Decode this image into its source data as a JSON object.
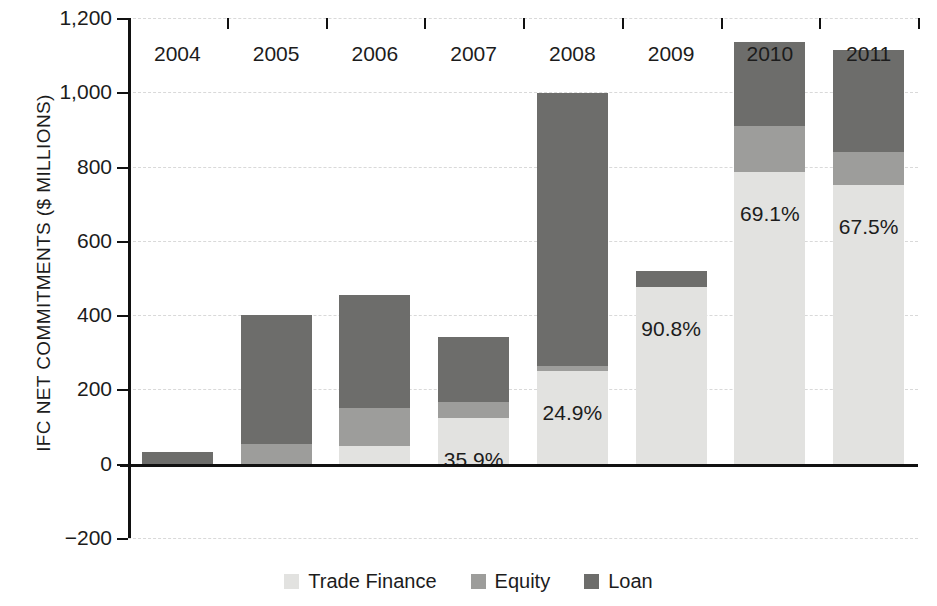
{
  "chart_data": {
    "type": "bar",
    "subtype": "stacked-bar",
    "title": "",
    "xlabel": "",
    "ylabel": "IFC NET COMMITMENTS ($ MILLIONS)",
    "categories": [
      "2004",
      "2005",
      "2006",
      "2007",
      "2008",
      "2009",
      "2010",
      "2011"
    ],
    "series": [
      {
        "name": "Trade Finance",
        "color": "#e2e2e0",
        "values": [
          0,
          0,
          48,
          122,
          250,
          475,
          785,
          750
        ]
      },
      {
        "name": "Equity",
        "color": "#9d9d9b",
        "values": [
          0,
          52,
          150,
          165,
          262,
          475,
          910,
          840
        ]
      },
      {
        "name": "Loan",
        "color": "#6d6d6b",
        "values": [
          32,
          400,
          455,
          340,
          998,
          520,
          1135,
          1115
        ]
      }
    ],
    "stack_note": "series values are cumulative stack tops in $ millions",
    "ylim": [
      -200,
      1200
    ],
    "yticks": [
      -200,
      0,
      200,
      400,
      600,
      800,
      1000,
      1200
    ],
    "ytick_labels": [
      "−200",
      "0",
      "200",
      "400",
      "600",
      "800",
      "1,000",
      "1,200"
    ],
    "grid": true,
    "legend_position": "bottom",
    "annotations": [
      {
        "category": "2007",
        "text": "35.9%"
      },
      {
        "category": "2008",
        "text": "24.9%"
      },
      {
        "category": "2009",
        "text": "90.8%"
      },
      {
        "category": "2010",
        "text": "69.1%"
      },
      {
        "category": "2011",
        "text": "67.5%"
      }
    ]
  },
  "axis": {
    "y_title": "IFC NET COMMITMENTS ($ MILLIONS)",
    "ticks": [
      {
        "label": "1,200",
        "value": 1200
      },
      {
        "label": "1,000",
        "value": 1000
      },
      {
        "label": "800",
        "value": 800
      },
      {
        "label": "600",
        "value": 600
      },
      {
        "label": "400",
        "value": 400
      },
      {
        "label": "200",
        "value": 200
      },
      {
        "label": "0",
        "value": 0
      },
      {
        "label": "−200",
        "value": -200
      }
    ]
  },
  "bars": [
    {
      "year": "2004",
      "trade_finance": 0,
      "equity": 0,
      "loan": 32,
      "total": 32,
      "pct_label": ""
    },
    {
      "year": "2005",
      "trade_finance": 0,
      "equity": 52,
      "loan": 348,
      "total": 400,
      "pct_label": ""
    },
    {
      "year": "2006",
      "trade_finance": 48,
      "equity": 102,
      "loan": 305,
      "total": 455,
      "pct_label": ""
    },
    {
      "year": "2007",
      "trade_finance": 122,
      "equity": 43,
      "loan": 175,
      "total": 340,
      "pct_label": "35.9%"
    },
    {
      "year": "2008",
      "trade_finance": 250,
      "equity": 12,
      "loan": 736,
      "total": 998,
      "pct_label": "24.9%"
    },
    {
      "year": "2009",
      "trade_finance": 475,
      "equity": 0,
      "loan": 45,
      "total": 520,
      "pct_label": "90.8%"
    },
    {
      "year": "2010",
      "trade_finance": 785,
      "equity": 125,
      "loan": 225,
      "total": 1135,
      "pct_label": "69.1%"
    },
    {
      "year": "2011",
      "trade_finance": 750,
      "equity": 90,
      "loan": 275,
      "total": 1115,
      "pct_label": "67.5%"
    }
  ],
  "legend": {
    "items": [
      {
        "label": "Trade Finance",
        "color": "#e2e2e0"
      },
      {
        "label": "Equity",
        "color": "#9d9d9b"
      },
      {
        "label": "Loan",
        "color": "#6d6d6b"
      }
    ]
  }
}
